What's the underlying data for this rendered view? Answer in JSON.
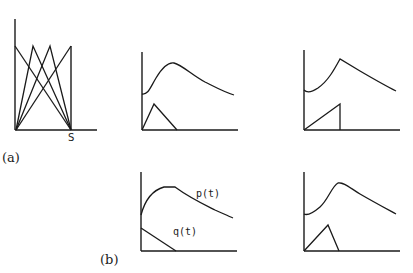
{
  "figure": {
    "panel_a": {
      "label": "(a)",
      "axis_tick_label": "S",
      "description": "Lines connecting origin and S to peaks forming crossing triangles"
    },
    "panel_b": {
      "label": "(b)",
      "curve_labels": {
        "p": "p(t)",
        "q": "q(t)"
      }
    },
    "subplots": [
      {
        "id": "top-middle",
        "upper_curve": "smooth rise to peak then decay",
        "lower_shape": "triangle"
      },
      {
        "id": "top-right",
        "upper_curve": "rise to sharp peak then decay",
        "lower_shape": "ramp then vertical drop"
      },
      {
        "id": "bottom-middle",
        "upper_curve": "p(t) rises, plateau, decays",
        "lower_shape": "q(t) linear decrease"
      },
      {
        "id": "bottom-right",
        "upper_curve": "smooth rise to peak then decay",
        "lower_shape": "triangle"
      }
    ],
    "colors": {
      "ink": "#1a1a1a",
      "background": "#ffffff"
    }
  }
}
